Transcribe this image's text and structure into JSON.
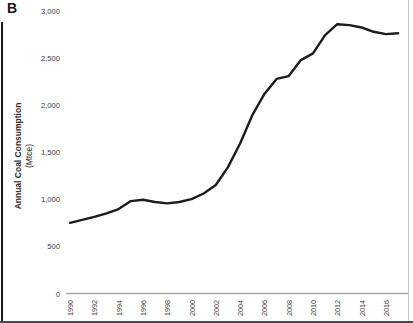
{
  "panel": {
    "label": "B"
  },
  "axis": {
    "y_title_line1": "Annual Coal Consumption",
    "y_title_line2": "(Mtce)"
  },
  "colors": {
    "line": "#1c1c1c",
    "axis_line": "#a6a6a6",
    "tick_text": "#3a3a3a",
    "border": "#1a1a1a"
  },
  "chart_data": {
    "type": "line",
    "title": "",
    "xlabel": "",
    "ylabel": "Annual Coal Consumption (Mtce)",
    "xlim": [
      1990,
      2017.5
    ],
    "ylim": [
      0,
      3000
    ],
    "grid": false,
    "legend": "none",
    "y_ticks": [
      {
        "value": 3000,
        "label": "3,000"
      },
      {
        "value": 2500,
        "label": "2,500"
      },
      {
        "value": 2000,
        "label": "2,000"
      },
      {
        "value": 1500,
        "label": "1,500"
      },
      {
        "value": 1000,
        "label": "1,000"
      },
      {
        "value": 500,
        "label": "500"
      },
      {
        "value": 0,
        "label": "0"
      }
    ],
    "x_ticks": [
      {
        "value": 1990,
        "label": "1990"
      },
      {
        "value": 1992,
        "label": "1992"
      },
      {
        "value": 1994,
        "label": "1994"
      },
      {
        "value": 1996,
        "label": "1996"
      },
      {
        "value": 1998,
        "label": "1998"
      },
      {
        "value": 2000,
        "label": "2000"
      },
      {
        "value": 2002,
        "label": "2002"
      },
      {
        "value": 2004,
        "label": "2004"
      },
      {
        "value": 2006,
        "label": "2006"
      },
      {
        "value": 2008,
        "label": "2008"
      },
      {
        "value": 2010,
        "label": "2010"
      },
      {
        "value": 2012,
        "label": "2012"
      },
      {
        "value": 2014,
        "label": "2014"
      },
      {
        "value": 2016,
        "label": "2016"
      }
    ],
    "series": [
      {
        "name": "Annual coal consumption",
        "x": [
          1990,
          1991,
          1992,
          1993,
          1994,
          1995,
          1996,
          1997,
          1998,
          1999,
          2000,
          2001,
          2002,
          2003,
          2004,
          2005,
          2006,
          2007,
          2008,
          2009,
          2010,
          2011,
          2012,
          2013,
          2014,
          2015,
          2016,
          2017
        ],
        "values": [
          755,
          785,
          818,
          855,
          900,
          985,
          1000,
          975,
          960,
          975,
          1005,
          1065,
          1155,
          1345,
          1595,
          1895,
          2120,
          2280,
          2310,
          2480,
          2550,
          2745,
          2860,
          2850,
          2825,
          2780,
          2755,
          2765
        ]
      }
    ]
  }
}
